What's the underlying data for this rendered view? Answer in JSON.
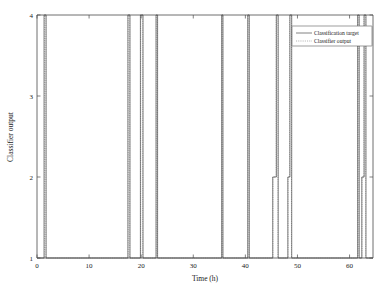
{
  "figure": {
    "background": "#ffffff",
    "frame_color": "#4a4a4a"
  },
  "chart_data": {
    "type": "line",
    "title": "",
    "xlabel": "Time (h)",
    "ylabel": "Classifier output",
    "xlim": [
      0,
      64.5
    ],
    "ylim": [
      1,
      4
    ],
    "xticks": [
      0,
      10,
      20,
      30,
      40,
      50,
      60
    ],
    "xticklabels": [
      "0",
      "10",
      "20",
      "30",
      "40",
      "50",
      "60"
    ],
    "yticks": [
      1,
      2,
      3,
      4
    ],
    "yticklabels": [
      "1",
      "2",
      "3",
      "4"
    ],
    "grid": false,
    "legend_position": "upper right",
    "legend": [
      {
        "name": "Classification target",
        "style": "solid",
        "color": "#3f3f3f"
      },
      {
        "name": "Classifier output",
        "style": "dotted",
        "color": "#8c8c8c"
      }
    ],
    "series": [
      {
        "name": "Classification target",
        "style": "solid",
        "color": "#3f3f3f",
        "step_points": [
          [
            0.0,
            1
          ],
          [
            1.35,
            1
          ],
          [
            1.35,
            4
          ],
          [
            1.75,
            4
          ],
          [
            1.75,
            1
          ],
          [
            17.45,
            1
          ],
          [
            17.45,
            4
          ],
          [
            17.85,
            4
          ],
          [
            17.85,
            1
          ],
          [
            19.85,
            1
          ],
          [
            19.85,
            4
          ],
          [
            20.35,
            4
          ],
          [
            20.35,
            1
          ],
          [
            22.85,
            1
          ],
          [
            22.85,
            4
          ],
          [
            23.15,
            4
          ],
          [
            23.15,
            1
          ],
          [
            35.45,
            1
          ],
          [
            35.45,
            4
          ],
          [
            35.7,
            4
          ],
          [
            35.7,
            1
          ],
          [
            40.45,
            1
          ],
          [
            40.45,
            4
          ],
          [
            40.75,
            4
          ],
          [
            40.75,
            1
          ],
          [
            45.25,
            1
          ],
          [
            45.25,
            2
          ],
          [
            45.95,
            2
          ],
          [
            45.95,
            4
          ],
          [
            46.3,
            4
          ],
          [
            46.3,
            1
          ],
          [
            48.15,
            1
          ],
          [
            48.15,
            2
          ],
          [
            48.55,
            2
          ],
          [
            48.55,
            4
          ],
          [
            48.9,
            4
          ],
          [
            48.9,
            1
          ],
          [
            61.55,
            1
          ],
          [
            61.55,
            4
          ],
          [
            61.85,
            4
          ],
          [
            61.85,
            1
          ],
          [
            62.35,
            1
          ],
          [
            62.35,
            2
          ],
          [
            62.8,
            2
          ],
          [
            62.8,
            4
          ],
          [
            63.15,
            4
          ],
          [
            63.15,
            1
          ],
          [
            64.5,
            1
          ]
        ]
      },
      {
        "name": "Classifier output",
        "style": "dotted",
        "color": "#8c8c8c",
        "step_points": [
          [
            0.0,
            1
          ],
          [
            1.45,
            1
          ],
          [
            1.45,
            4
          ],
          [
            1.7,
            4
          ],
          [
            1.7,
            1
          ],
          [
            17.5,
            1
          ],
          [
            17.5,
            4
          ],
          [
            17.8,
            4
          ],
          [
            17.8,
            1
          ],
          [
            19.9,
            1
          ],
          [
            19.9,
            4
          ],
          [
            20.3,
            4
          ],
          [
            20.3,
            1
          ],
          [
            22.9,
            1
          ],
          [
            22.9,
            4
          ],
          [
            23.1,
            4
          ],
          [
            23.1,
            1
          ],
          [
            35.5,
            1
          ],
          [
            35.5,
            4
          ],
          [
            35.65,
            4
          ],
          [
            35.65,
            1
          ],
          [
            40.5,
            1
          ],
          [
            40.5,
            4
          ],
          [
            40.7,
            4
          ],
          [
            40.7,
            1
          ],
          [
            45.3,
            1
          ],
          [
            45.3,
            2
          ],
          [
            45.9,
            2
          ],
          [
            45.9,
            4
          ],
          [
            46.25,
            4
          ],
          [
            46.25,
            1
          ],
          [
            48.2,
            1
          ],
          [
            48.2,
            2
          ],
          [
            48.5,
            2
          ],
          [
            48.5,
            4
          ],
          [
            48.85,
            4
          ],
          [
            48.85,
            1
          ],
          [
            61.6,
            1
          ],
          [
            61.6,
            4
          ],
          [
            61.8,
            4
          ],
          [
            61.8,
            1
          ],
          [
            62.4,
            1
          ],
          [
            62.4,
            2
          ],
          [
            62.75,
            2
          ],
          [
            62.75,
            4
          ],
          [
            63.1,
            4
          ],
          [
            63.1,
            1
          ],
          [
            64.5,
            1
          ]
        ]
      }
    ],
    "pulse_events": [
      {
        "time": 1.55,
        "level": 4
      },
      {
        "time": 17.65,
        "level": 4
      },
      {
        "time": 20.1,
        "level": 4
      },
      {
        "time": 23.0,
        "level": 4
      },
      {
        "time": 35.55,
        "level": 4
      },
      {
        "time": 40.6,
        "level": 4
      },
      {
        "time": 45.6,
        "level": 2
      },
      {
        "time": 46.1,
        "level": 4
      },
      {
        "time": 48.35,
        "level": 2
      },
      {
        "time": 48.7,
        "level": 4
      },
      {
        "time": 61.7,
        "level": 4
      },
      {
        "time": 62.55,
        "level": 2
      },
      {
        "time": 62.95,
        "level": 4
      }
    ]
  }
}
